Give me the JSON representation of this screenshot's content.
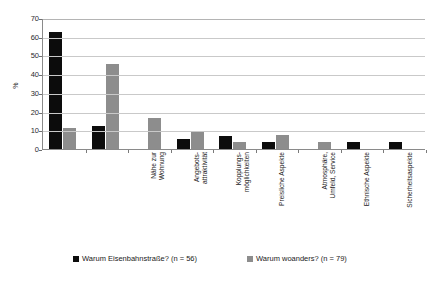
{
  "chart_data": {
    "type": "bar",
    "title": "",
    "xlabel": "",
    "ylabel": "%",
    "ylim": [
      0,
      70
    ],
    "ytick_step": 10,
    "yticks": [
      70,
      60,
      50,
      40,
      30,
      20,
      10,
      0
    ],
    "grid": true,
    "legend_position": "bottom",
    "categories": [
      "Nähe zur\nWohnung",
      "Angebots-\nattraktivität",
      "Kopplungs-\nmöglichkeiten",
      "Preisliche Aspekte",
      "Atmosphäre,\nUmfeld, Service",
      "Ethnische Aspekte",
      "Sicherheitsaspekte",
      "Nähe zu\nBekannten",
      "Verkehrsanbindung"
    ],
    "series": [
      {
        "name": "Warum Eisenbahnstraße? (n = 56)",
        "color": "#0c0c0c",
        "values": [
          62.5,
          12.5,
          0,
          5.4,
          7.1,
          3.6,
          0,
          3.6,
          3.6
        ]
      },
      {
        "name": "Warum woanders? (n = 79)",
        "color": "#8d8d8d",
        "values": [
          11.4,
          45.6,
          16.5,
          8.9,
          3.8,
          7.6,
          3.8,
          0,
          0
        ]
      }
    ]
  },
  "legend": {
    "entries": [
      {
        "label": "Warum Eisenbahnstraße? (n = 56)",
        "swatch": "black"
      },
      {
        "label": "Warum woanders? (n = 79)",
        "swatch": "gray"
      }
    ]
  },
  "axis": {
    "y_title": "%"
  },
  "caption": {
    "text": ""
  }
}
